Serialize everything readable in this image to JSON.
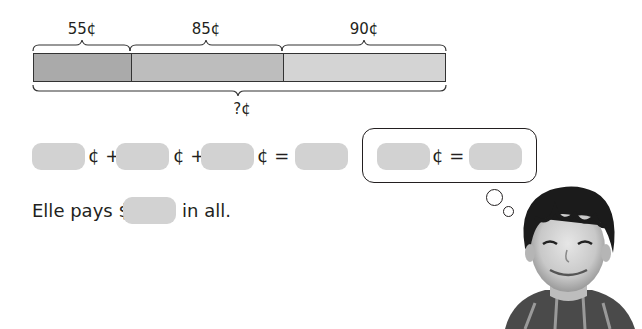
{
  "bar_model": {
    "segments": [
      {
        "label": "55¢",
        "value_cents": 55,
        "color": "#aaaaaa"
      },
      {
        "label": "85¢",
        "value_cents": 85,
        "color": "#bdbdbd"
      },
      {
        "label": "90¢",
        "value_cents": 90,
        "color": "#d4d4d4"
      }
    ],
    "total_label": "?¢"
  },
  "equation": {
    "sym1": "¢ +",
    "sym2": "¢ +",
    "sym3": "¢ = $"
  },
  "thought_bubble": {
    "sym": "¢ = $"
  },
  "sentence": {
    "before": "Elle pays $",
    "after": "in all."
  },
  "colors": {
    "blank_fill": "#d2d2d2",
    "text": "#231f20"
  }
}
